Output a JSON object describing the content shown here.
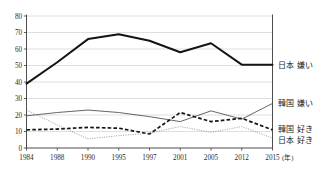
{
  "chart_data": {
    "type": "line",
    "title": "",
    "xlabel": "",
    "ylabel": "",
    "x_unit_label": "(年)",
    "categories": [
      "1984",
      "1988",
      "1990",
      "1995",
      "1997",
      "2001",
      "2005",
      "2012",
      "2015"
    ],
    "ylim": [
      0,
      80
    ],
    "ytick_step": 10,
    "yticks": [
      "0",
      "10",
      "20",
      "30",
      "40",
      "50",
      "60",
      "70",
      "80"
    ],
    "grid": true,
    "legend_position": "right",
    "series": [
      {
        "name": "日本 嫌い",
        "style": "thick-solid",
        "color": "#141414",
        "values": [
          39,
          52,
          66,
          69,
          65,
          58,
          63.5,
          50.5,
          50.5
        ]
      },
      {
        "name": "韓国 嫌い",
        "style": "thin-solid",
        "color": "#4a4a4a",
        "values": [
          19.5,
          21.5,
          23,
          21.5,
          19,
          16,
          22.5,
          17.5,
          27
        ]
      },
      {
        "name": "韓国 好き",
        "style": "dashed",
        "color": "#141414",
        "values": [
          11,
          11.5,
          12.5,
          12,
          8.5,
          21.5,
          16,
          18,
          11
        ]
      },
      {
        "name": "日本 好き",
        "style": "dotted",
        "color": "#8d8d8d",
        "values": [
          23,
          14,
          5.5,
          7.5,
          9,
          13,
          9.5,
          13,
          6
        ]
      }
    ]
  },
  "legend": {
    "items": [
      {
        "label": "日本 嫌い",
        "value_at_end": 50.5
      },
      {
        "label": "韓国 嫌い",
        "value_at_end": 27
      },
      {
        "label": "韓国 好き",
        "value_at_end": 11
      },
      {
        "label": "日本 好き",
        "value_at_end": 6
      }
    ]
  },
  "top_note": ""
}
